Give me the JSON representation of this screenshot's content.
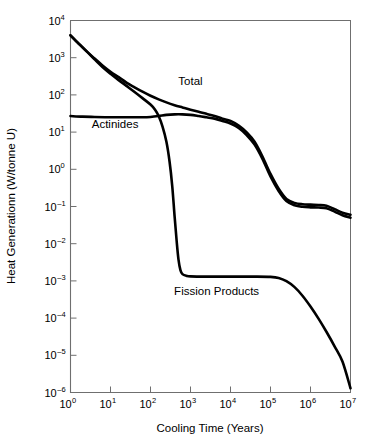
{
  "chart_data": {
    "type": "line",
    "title": "",
    "xlabel": "Cooling Time (Years)",
    "ylabel": "Heat Generationn (W/tonne U)",
    "xscale": "log",
    "yscale": "log",
    "xlim": [
      1,
      10000000
    ],
    "ylim": [
      1e-06,
      10000
    ],
    "grid": false,
    "legend": "inline-annotations",
    "xticks": [
      {
        "value": 1,
        "base": "10",
        "exp": "0",
        "label": "10⁰"
      },
      {
        "value": 10,
        "base": "10",
        "exp": "1",
        "label": "10¹"
      },
      {
        "value": 100,
        "base": "10",
        "exp": "2",
        "label": "10²"
      },
      {
        "value": 1000,
        "base": "10",
        "exp": "3",
        "label": "10³"
      },
      {
        "value": 10000,
        "base": "10",
        "exp": "4",
        "label": "10⁴"
      },
      {
        "value": 100000,
        "base": "10",
        "exp": "5",
        "label": "10⁵"
      },
      {
        "value": 1000000,
        "base": "10",
        "exp": "6",
        "label": "10⁶"
      },
      {
        "value": 10000000,
        "base": "10",
        "exp": "7",
        "label": "10⁷"
      }
    ],
    "yticks": [
      {
        "value": 10000,
        "base": "10",
        "exp": "4"
      },
      {
        "value": 1000,
        "base": "10",
        "exp": "3"
      },
      {
        "value": 100,
        "base": "10",
        "exp": "2"
      },
      {
        "value": 10,
        "base": "10",
        "exp": "1"
      },
      {
        "value": 1,
        "base": "10",
        "exp": "0"
      },
      {
        "value": 0.1,
        "base": "10",
        "exp": "–1"
      },
      {
        "value": 0.01,
        "base": "10",
        "exp": "–2"
      },
      {
        "value": 0.001,
        "base": "10",
        "exp": "–3"
      },
      {
        "value": 0.0001,
        "base": "10",
        "exp": "–4"
      },
      {
        "value": 1e-05,
        "base": "10",
        "exp": "–5"
      },
      {
        "value": 1e-06,
        "base": "10",
        "exp": "–6"
      }
    ],
    "series": [
      {
        "name": "Total",
        "label": "Total",
        "label_x": 1000,
        "label_y": 180,
        "color": "#000000",
        "points": [
          [
            1,
            4000
          ],
          [
            1.6,
            2400
          ],
          [
            2.5,
            1500
          ],
          [
            4,
            950
          ],
          [
            6.3,
            620
          ],
          [
            10,
            420
          ],
          [
            16,
            300
          ],
          [
            25,
            215
          ],
          [
            40,
            160
          ],
          [
            63,
            122
          ],
          [
            100,
            95
          ],
          [
            160,
            76
          ],
          [
            250,
            63
          ],
          [
            400,
            53
          ],
          [
            630,
            46
          ],
          [
            1000,
            40
          ],
          [
            1600,
            35
          ],
          [
            2500,
            31
          ],
          [
            4000,
            27
          ],
          [
            6300,
            23
          ],
          [
            10000,
            20
          ],
          [
            16000,
            15
          ],
          [
            25000,
            10
          ],
          [
            40000,
            5.5
          ],
          [
            63000,
            2.2
          ],
          [
            100000,
            0.75
          ],
          [
            160000,
            0.3
          ],
          [
            250000,
            0.16
          ],
          [
            400000,
            0.125
          ],
          [
            630000,
            0.115
          ],
          [
            1000000,
            0.112
          ],
          [
            1600000,
            0.11
          ],
          [
            2500000,
            0.105
          ],
          [
            4000000,
            0.085
          ],
          [
            6300000,
            0.068
          ],
          [
            10000000,
            0.06
          ]
        ]
      },
      {
        "name": "Actinides",
        "label": "Actinides",
        "label_x": 13,
        "label_y": 13,
        "color": "#000000",
        "points": [
          [
            1,
            27
          ],
          [
            2,
            26
          ],
          [
            4,
            25.5
          ],
          [
            10,
            25
          ],
          [
            25,
            25
          ],
          [
            63,
            25
          ],
          [
            100,
            25.5
          ],
          [
            160,
            27
          ],
          [
            250,
            29
          ],
          [
            400,
            30
          ],
          [
            630,
            30
          ],
          [
            1000,
            29
          ],
          [
            1600,
            27
          ],
          [
            2500,
            25
          ],
          [
            4000,
            23
          ],
          [
            6300,
            20
          ],
          [
            10000,
            17
          ],
          [
            16000,
            13
          ],
          [
            25000,
            8.5
          ],
          [
            40000,
            4.6
          ],
          [
            63000,
            1.9
          ],
          [
            100000,
            0.64
          ],
          [
            160000,
            0.26
          ],
          [
            250000,
            0.14
          ],
          [
            400000,
            0.108
          ],
          [
            630000,
            0.098
          ],
          [
            1000000,
            0.095
          ],
          [
            1600000,
            0.094
          ],
          [
            2500000,
            0.09
          ],
          [
            4000000,
            0.073
          ],
          [
            6300000,
            0.058
          ],
          [
            10000000,
            0.05
          ]
        ]
      },
      {
        "name": "Fission Products",
        "label": "Fission Products",
        "label_x": 4500,
        "label_y": 0.00042,
        "color": "#000000",
        "points": [
          [
            1,
            4000
          ],
          [
            1.6,
            2400
          ],
          [
            2.5,
            1500
          ],
          [
            4,
            900
          ],
          [
            6.3,
            560
          ],
          [
            10,
            370
          ],
          [
            16,
            250
          ],
          [
            25,
            175
          ],
          [
            40,
            120
          ],
          [
            63,
            82
          ],
          [
            100,
            55
          ],
          [
            130,
            40
          ],
          [
            160,
            27
          ],
          [
            200,
            14
          ],
          [
            250,
            5.5
          ],
          [
            300,
            1.6
          ],
          [
            350,
            0.35
          ],
          [
            400,
            0.055
          ],
          [
            450,
            0.012
          ],
          [
            500,
            0.0038
          ],
          [
            560,
            0.00195
          ],
          [
            630,
            0.00152
          ],
          [
            800,
            0.00136
          ],
          [
            1000,
            0.00132
          ],
          [
            2500,
            0.0013
          ],
          [
            10000,
            0.0013
          ],
          [
            40000,
            0.0013
          ],
          [
            100000,
            0.00128
          ],
          [
            160000,
            0.0012
          ],
          [
            250000,
            0.00098
          ],
          [
            400000,
            0.00068
          ],
          [
            630000,
            0.0004
          ],
          [
            1000000,
            0.000205
          ],
          [
            1600000,
            9.55e-05
          ],
          [
            2500000,
            4.3e-05
          ],
          [
            4000000,
            1.75e-05
          ],
          [
            6300000,
            6.8e-06
          ],
          [
            10000000,
            1.3e-06
          ]
        ]
      }
    ]
  },
  "axes": {
    "x_title": "Cooling Time (Years)",
    "y_title": "Heat Generationn (W/tonne U)"
  }
}
